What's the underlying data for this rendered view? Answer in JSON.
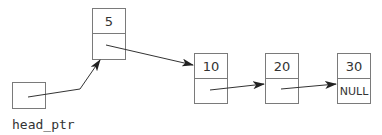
{
  "diagram": {
    "type": "linked-list",
    "head_label": "head_ptr",
    "nodes": [
      {
        "value": "5",
        "next": ""
      },
      {
        "value": "10",
        "next": ""
      },
      {
        "value": "20",
        "next": ""
      },
      {
        "value": "30",
        "next": "NULL"
      }
    ],
    "colors": {
      "stroke": "#7a7a7a",
      "arrow": "#333333",
      "text": "#333333"
    }
  }
}
